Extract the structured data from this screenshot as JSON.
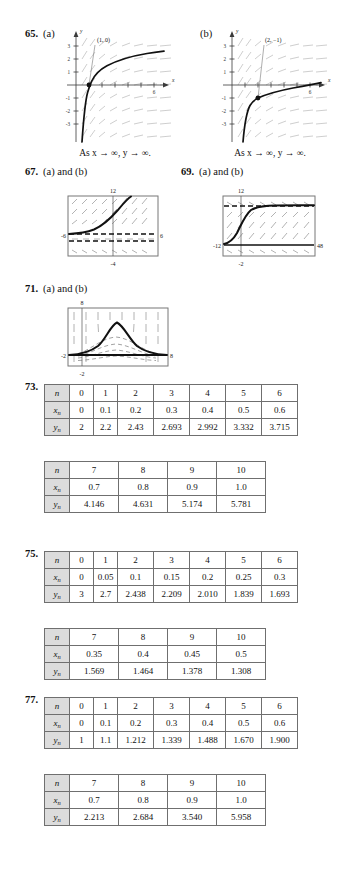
{
  "page": {
    "width": 339,
    "height": 886,
    "background": "#ffffff",
    "text_color": "#111111",
    "grid_color": "#b9b9b9",
    "table_header_fill": "#dcdcdc",
    "table_border": "#6f6f6f"
  },
  "problems": {
    "p65": {
      "number": "65.",
      "part_a_label": "(a)",
      "part_b_label": "(b)",
      "caption_a": "As x → ∞, y → ∞.",
      "caption_b": "As x → ∞, y → ∞."
    },
    "p67": {
      "number": "67.",
      "label": "(a) and (b)"
    },
    "p69": {
      "number": "69.",
      "label": "(a) and (b)"
    },
    "p71": {
      "number": "71.",
      "label": "(a) and (b)"
    },
    "p73": {
      "number": "73."
    },
    "p75": {
      "number": "75."
    },
    "p77": {
      "number": "77."
    }
  },
  "chart_data": [
    {
      "id": "plot-65a",
      "type": "line",
      "title": "65 (a)",
      "xlabel": "x",
      "ylabel": "y",
      "xlim": [
        -1.2,
        7.0
      ],
      "ylim": [
        -3.4,
        3.6
      ],
      "xticks": [
        1,
        2,
        3,
        4,
        5,
        6
      ],
      "xtick_labels": [
        "",
        "",
        "",
        "",
        "",
        "6"
      ],
      "yticks": [
        -3,
        -2,
        -1,
        1,
        2,
        3
      ],
      "ytick_labels": [
        "-3",
        "-2",
        "-1",
        "1",
        "2",
        "3"
      ],
      "grid": false,
      "annotations": [
        {
          "text": "(1, 0)",
          "x": 1,
          "y": 0,
          "label_x": 1.95,
          "label_y": 3.3
        }
      ],
      "marked_points": [
        {
          "x": 1,
          "y": 0
        }
      ],
      "series": [
        {
          "name": "solution curve (logarithmic)",
          "points": [
            [
              0.08,
              -3.4
            ],
            [
              0.15,
              -2.3
            ],
            [
              0.25,
              -1.55
            ],
            [
              0.4,
              -1.0
            ],
            [
              0.6,
              -0.55
            ],
            [
              0.8,
              -0.24
            ],
            [
              1.0,
              0.0
            ],
            [
              1.4,
              0.38
            ],
            [
              2.0,
              0.78
            ],
            [
              2.8,
              1.15
            ],
            [
              3.6,
              1.4
            ],
            [
              4.5,
              1.6
            ],
            [
              5.4,
              1.75
            ],
            [
              6.4,
              1.9
            ]
          ]
        }
      ],
      "slope_field": "logarithmic slope field, light gray dashes"
    },
    {
      "id": "plot-65b",
      "type": "line",
      "title": "65 (b)",
      "xlabel": "x",
      "ylabel": "y",
      "xlim": [
        -1.2,
        7.0
      ],
      "ylim": [
        -3.4,
        3.6
      ],
      "xticks": [
        1,
        2,
        3,
        4,
        5,
        6
      ],
      "xtick_labels": [
        "",
        "",
        "",
        "",
        "",
        "6"
      ],
      "yticks": [
        -3,
        -2,
        -1,
        1,
        2,
        3
      ],
      "ytick_labels": [
        "-3",
        "-2",
        "-1",
        "1",
        "2",
        "3"
      ],
      "grid": false,
      "annotations": [
        {
          "text": "(2, -1)",
          "x": 2,
          "y": -1,
          "label_x": 2.6,
          "label_y": 3.3
        }
      ],
      "marked_points": [
        {
          "x": 2,
          "y": -1
        }
      ],
      "series": [
        {
          "name": "solution curve (logarithmic, shifted)",
          "points": [
            [
              0.25,
              -3.4
            ],
            [
              0.4,
              -2.5
            ],
            [
              0.6,
              -2.0
            ],
            [
              0.9,
              -1.55
            ],
            [
              1.3,
              -1.25
            ],
            [
              2.0,
              -1.0
            ],
            [
              2.8,
              -0.78
            ],
            [
              3.6,
              -0.6
            ],
            [
              4.5,
              -0.42
            ],
            [
              5.4,
              -0.25
            ],
            [
              6.3,
              -0.02
            ],
            [
              6.8,
              0.12
            ]
          ]
        }
      ],
      "slope_field": "logarithmic slope field, light gray dashes"
    },
    {
      "id": "plot-67",
      "type": "line",
      "title": "67 (a) and (b)",
      "grid": false,
      "xlim": [
        -6,
        6
      ],
      "ylim": [
        -4,
        12
      ],
      "axis_labels": {
        "left": "-6",
        "right": "6",
        "top": "12",
        "bottom": "-4"
      },
      "series": [
        {
          "name": "increasing solution curve",
          "points": [
            [
              -6.0,
              1.0
            ],
            [
              -4.6,
              1.1
            ],
            [
              -3.4,
              1.35
            ],
            [
              -2.4,
              1.8
            ],
            [
              -1.4,
              2.6
            ],
            [
              -0.5,
              3.6
            ],
            [
              0.4,
              5.1
            ],
            [
              1.3,
              7.0
            ],
            [
              2.1,
              9.2
            ],
            [
              2.7,
              11.3
            ]
          ]
        }
      ],
      "horizontal_asymptotes": [
        1.0,
        0.0,
        -0.8
      ],
      "vertical_reference": 0
    },
    {
      "id": "plot-69",
      "type": "line",
      "title": "69 (a) and (b)",
      "grid": false,
      "xlim": [
        -12,
        48
      ],
      "ylim": [
        -2,
        12
      ],
      "axis_labels": {
        "left": "-12",
        "right": "48",
        "top": "12",
        "bottom": "-2"
      },
      "series": [
        {
          "name": "sigmoid solution curve",
          "points": [
            [
              -12,
              0.2
            ],
            [
              -9,
              0.5
            ],
            [
              -6,
              1.4
            ],
            [
              -3,
              3.2
            ],
            [
              0,
              5.8
            ],
            [
              3,
              8.2
            ],
            [
              7,
              9.6
            ],
            [
              14,
              10.0
            ],
            [
              26,
              10.1
            ],
            [
              40,
              10.1
            ],
            [
              48,
              10.1
            ]
          ]
        }
      ],
      "horizontal_asymptotes": [
        10.1,
        0.2
      ],
      "vertical_reference": -2
    },
    {
      "id": "plot-71",
      "type": "line",
      "title": "71 (a) and (b)",
      "grid": false,
      "xlim": [
        -2,
        8
      ],
      "ylim": [
        -2,
        8
      ],
      "axis_labels": {
        "left": "-2",
        "right": "8",
        "top": "8",
        "bottom": "-2"
      },
      "series": [
        {
          "name": "bell-shaped solution curve",
          "points": [
            [
              -2.0,
              0.05
            ],
            [
              -0.8,
              0.15
            ],
            [
              0.2,
              0.5
            ],
            [
              0.9,
              1.2
            ],
            [
              1.6,
              2.6
            ],
            [
              2.3,
              4.2
            ],
            [
              2.9,
              5.0
            ],
            [
              3.6,
              4.6
            ],
            [
              4.3,
              3.3
            ],
            [
              5.0,
              1.9
            ],
            [
              5.8,
              0.8
            ],
            [
              6.8,
              0.2
            ],
            [
              8.0,
              0.05
            ]
          ]
        }
      ],
      "family_curves": 4,
      "vertical_reference": 0
    }
  ],
  "tables": [
    {
      "id": "t73a",
      "problem": "73.",
      "columns": 7,
      "rows": [
        {
          "head": "n",
          "head_sub": "",
          "values": [
            "0",
            "1",
            "2",
            "3",
            "4",
            "5",
            "6"
          ]
        },
        {
          "head": "x",
          "head_sub": "n",
          "values": [
            "0",
            "0.1",
            "0.2",
            "0.3",
            "0.4",
            "0.5",
            "0.6"
          ]
        },
        {
          "head": "y",
          "head_sub": "n",
          "values": [
            "2",
            "2.2",
            "2.43",
            "2.693",
            "2.992",
            "3.332",
            "3.715"
          ]
        }
      ]
    },
    {
      "id": "t73b",
      "problem": "",
      "columns": 4,
      "rows": [
        {
          "head": "n",
          "head_sub": "",
          "values": [
            "7",
            "8",
            "9",
            "10"
          ]
        },
        {
          "head": "x",
          "head_sub": "n",
          "values": [
            "0.7",
            "0.8",
            "0.9",
            "1.0"
          ]
        },
        {
          "head": "y",
          "head_sub": "n",
          "values": [
            "4.146",
            "4.631",
            "5.174",
            "5.781"
          ]
        }
      ]
    },
    {
      "id": "t75a",
      "problem": "75.",
      "columns": 7,
      "rows": [
        {
          "head": "n",
          "head_sub": "",
          "values": [
            "0",
            "1",
            "2",
            "3",
            "4",
            "5",
            "6"
          ]
        },
        {
          "head": "x",
          "head_sub": "n",
          "values": [
            "0",
            "0.05",
            "0.1",
            "0.15",
            "0.2",
            "0.25",
            "0.3"
          ]
        },
        {
          "head": "y",
          "head_sub": "n",
          "values": [
            "3",
            "2.7",
            "2.438",
            "2.209",
            "2.010",
            "1.839",
            "1.693"
          ]
        }
      ]
    },
    {
      "id": "t75b",
      "problem": "",
      "columns": 4,
      "rows": [
        {
          "head": "n",
          "head_sub": "",
          "values": [
            "7",
            "8",
            "9",
            "10"
          ]
        },
        {
          "head": "x",
          "head_sub": "n",
          "values": [
            "0.35",
            "0.4",
            "0.45",
            "0.5"
          ]
        },
        {
          "head": "y",
          "head_sub": "n",
          "values": [
            "1.569",
            "1.464",
            "1.378",
            "1.308"
          ]
        }
      ]
    },
    {
      "id": "t77a",
      "problem": "77.",
      "columns": 7,
      "rows": [
        {
          "head": "n",
          "head_sub": "",
          "values": [
            "0",
            "1",
            "2",
            "3",
            "4",
            "5",
            "6"
          ]
        },
        {
          "head": "x",
          "head_sub": "n",
          "values": [
            "0",
            "0.1",
            "0.2",
            "0.3",
            "0.4",
            "0.5",
            "0.6"
          ]
        },
        {
          "head": "y",
          "head_sub": "n",
          "values": [
            "1",
            "1.1",
            "1.212",
            "1.339",
            "1.488",
            "1.670",
            "1.900"
          ]
        }
      ]
    },
    {
      "id": "t77b",
      "problem": "",
      "columns": 4,
      "rows": [
        {
          "head": "n",
          "head_sub": "",
          "values": [
            "7",
            "8",
            "9",
            "10"
          ]
        },
        {
          "head": "x",
          "head_sub": "n",
          "values": [
            "0.7",
            "0.8",
            "0.9",
            "1.0"
          ]
        },
        {
          "head": "y",
          "head_sub": "n",
          "values": [
            "2.213",
            "2.684",
            "3.540",
            "5.958"
          ]
        }
      ]
    }
  ]
}
